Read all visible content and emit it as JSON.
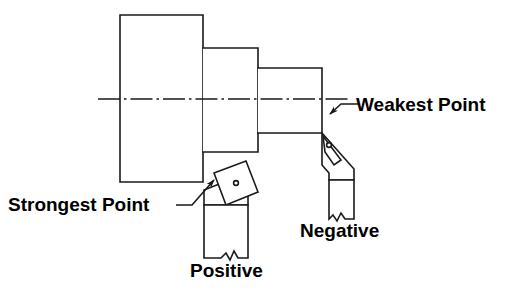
{
  "diagram": {
    "stroke_color": "#1a1a1a",
    "fill_color": "#ffffff",
    "background_color": "#ffffff",
    "annotations": {
      "weakest_point": "Weakest Point",
      "strongest_point": "Strongest Point",
      "negative": "Negative",
      "positive": "Positive"
    },
    "workpiece": {
      "name": "stepped-shaft",
      "centerline_y": 99,
      "centerline_x_start": 98,
      "centerline_x_end": 350,
      "steps": [
        {
          "name": "large-diameter-step",
          "x": 120,
          "y": 15,
          "width": 83,
          "height": 167
        },
        {
          "name": "medium-diameter-step",
          "x": 203,
          "y": 48,
          "width": 55,
          "height": 104
        },
        {
          "name": "small-diameter-step",
          "x": 258,
          "y": 68,
          "width": 64,
          "height": 65
        }
      ]
    },
    "tools": [
      {
        "name": "negative-rake-tool",
        "label": "Negative",
        "insert_type": "rhombic-negative-insert",
        "insert_hole": true,
        "contact_point": "weakest",
        "shank_break_line": true
      },
      {
        "name": "positive-rake-tool",
        "label": "Positive",
        "insert_type": "square-positive-insert",
        "insert_hole": true,
        "insert_rotation_deg": -20,
        "contact_point": "strongest",
        "shank_break_line": true
      }
    ],
    "leaders": [
      {
        "name": "weakest-point-leader",
        "from": "Weakest Point",
        "to": "negative-insert-tip",
        "arrow": true
      },
      {
        "name": "strongest-point-leader",
        "from": "Strongest Point",
        "to": "positive-insert-corner",
        "arrow": true
      }
    ]
  }
}
